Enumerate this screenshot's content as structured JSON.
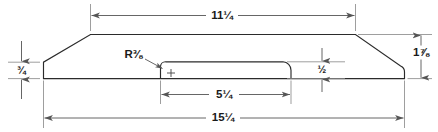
{
  "diagram": {
    "type": "engineering-dimension-drawing",
    "units": "inches",
    "line_color": "#2b2b2b",
    "dimension_color": "#555555",
    "extension_color": "#8d8d8d",
    "background_color": "#ffffff",
    "dimensions": [
      {
        "id": "top-width",
        "label": "11¼",
        "value": 11.25,
        "orientation": "horizontal",
        "position": "top",
        "describes": "width of the flat top face"
      },
      {
        "id": "left-thickness",
        "label": "¾",
        "value": 0.75,
        "orientation": "vertical",
        "position": "left",
        "describes": "thickness at the left edge"
      },
      {
        "id": "right-height",
        "label": "1⅞",
        "value": 1.875,
        "orientation": "vertical",
        "position": "right",
        "describes": "overall height of the blank"
      },
      {
        "id": "recess-depth",
        "label": "½",
        "value": 0.5,
        "orientation": "vertical",
        "position": "interior-right",
        "describes": "depth of the scooped recess"
      },
      {
        "id": "recess-width",
        "label": "5¼",
        "value": 5.25,
        "orientation": "horizontal",
        "position": "bottom-inner",
        "describes": "width of the scooped recess"
      },
      {
        "id": "overall-width",
        "label": "15¼",
        "value": 15.25,
        "orientation": "horizontal",
        "position": "bottom",
        "describes": "overall width of the blank"
      }
    ],
    "callouts": [
      {
        "id": "fillet-radius",
        "label": "R⅜",
        "value": 0.375,
        "describes": "fillet radius at the start of the recess"
      }
    ],
    "markers": [
      {
        "id": "radius-center-mark",
        "glyph": "+",
        "describes": "center point of the R⅜ fillet"
      }
    ]
  }
}
